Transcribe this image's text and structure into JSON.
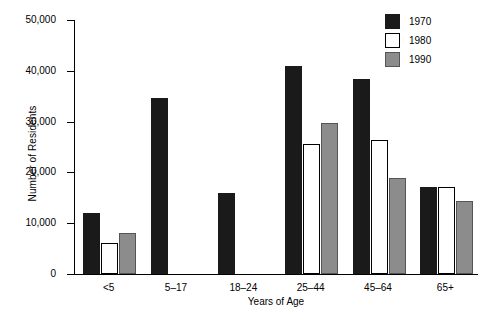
{
  "chart_data": {
    "type": "bar",
    "title": "",
    "xlabel": "Years of Age",
    "ylabel": "Number of Residents",
    "categories": [
      "<5",
      "5–17",
      "18–24",
      "25–44",
      "45–64",
      "65+"
    ],
    "series": [
      {
        "name": "1970",
        "color": "#1a1a1a",
        "values": [
          12000,
          34700,
          15900,
          41000,
          38400,
          17200
        ]
      },
      {
        "name": "1980",
        "color": "#ffffff",
        "values": [
          6200,
          0,
          0,
          25600,
          26400,
          17200
        ]
      },
      {
        "name": "1990",
        "color": "#8c8c8c",
        "values": [
          8000,
          0,
          0,
          29800,
          18900,
          14400
        ]
      }
    ],
    "ylim": [
      0,
      50000
    ],
    "ytick_values": [
      0,
      10000,
      20000,
      30000,
      40000,
      50000
    ],
    "ytick_labels": [
      "0",
      "10,000",
      "20,000",
      "30,000",
      "40,000",
      "50,000"
    ],
    "grid": false,
    "legend_position": "top-right"
  },
  "legend": {
    "entries": [
      {
        "label": "1970"
      },
      {
        "label": "1980"
      },
      {
        "label": "1990"
      }
    ]
  }
}
